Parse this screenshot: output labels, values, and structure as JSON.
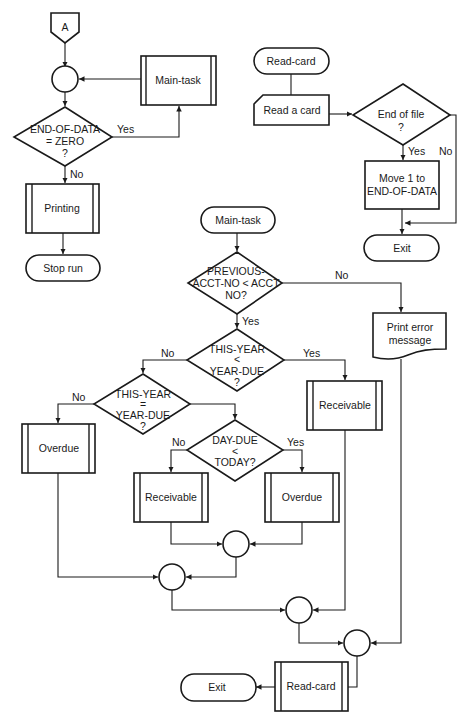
{
  "diagram": {
    "type": "flowchart",
    "main_routine": {
      "entry_connector": "A",
      "main_task_call": "Main-task",
      "loop_decision": {
        "lines": [
          "END-OF-DATA",
          "= ZERO",
          "?"
        ],
        "yes": "Yes",
        "no": "No"
      },
      "printing_call": "Printing",
      "stop": "Stop run"
    },
    "read_card_routine": {
      "start": "Read-card",
      "read_input": "Read a card",
      "eof_decision": {
        "lines": [
          "End of file",
          "?"
        ],
        "yes": "Yes",
        "no": "No"
      },
      "set_flag": [
        "Move 1 to",
        "END-OF-DATA"
      ],
      "exit": "Exit"
    },
    "main_task_routine": {
      "start": "Main-task",
      "acct_decision": {
        "lines": [
          "PREVIOUS-",
          "ACCT-NO < ACCT",
          "NO?"
        ],
        "yes": "Yes",
        "no": "No"
      },
      "print_error": [
        "Print error",
        "message"
      ],
      "year_lt_decision": {
        "lines": [
          "THIS-YEAR",
          "<",
          "YEAR-DUE",
          "?"
        ],
        "yes": "Yes",
        "no": "No"
      },
      "receivable_1": "Receivable",
      "year_eq_decision": {
        "lines": [
          "THIS-YEAR",
          "=",
          "YEAR-DUE",
          "?"
        ],
        "yes": "Yes",
        "no": "No"
      },
      "overdue_1": "Overdue",
      "day_decision": {
        "lines": [
          "DAY-DUE",
          "<",
          "TODAY?"
        ],
        "yes": "Yes",
        "no": "No"
      },
      "receivable_2": "Receivable",
      "overdue_2": "Overdue",
      "read_card_call": "Read-card",
      "exit": "Exit"
    }
  }
}
